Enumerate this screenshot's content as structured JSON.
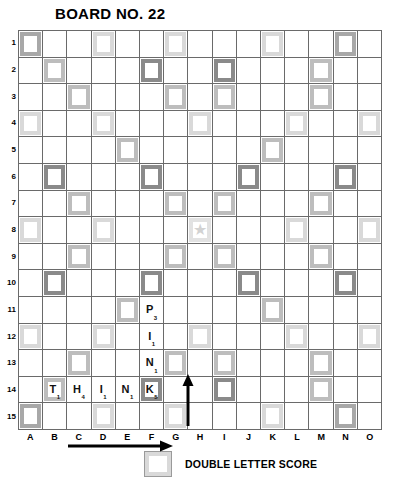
{
  "title": "BOARD NO. 22",
  "board": {
    "columns": [
      "A",
      "B",
      "C",
      "D",
      "E",
      "F",
      "G",
      "H",
      "I",
      "J",
      "K",
      "L",
      "M",
      "N",
      "O"
    ],
    "rows": [
      "1",
      "2",
      "3",
      "4",
      "5",
      "6",
      "7",
      "8",
      "9",
      "10",
      "11",
      "12",
      "13",
      "14",
      "15"
    ],
    "center_star": "star",
    "premium_squares": {
      "note": "grid of 15 rows x 15 cols; codes: '' none, 'dls' double letter, 'dls2' double letter dark, 'tls' triple letter, 'tws' triple word",
      "cells": [
        [
          "tws",
          "",
          "",
          "dls",
          "",
          "",
          "dls",
          "",
          "",
          "",
          "dls",
          "",
          "",
          "tws",
          ""
        ],
        [
          "",
          "dls2",
          "",
          "",
          "",
          "tls",
          "",
          "",
          "tls",
          "",
          "",
          "",
          "dls2",
          "",
          ""
        ],
        [
          "",
          "",
          "dls2",
          "",
          "",
          "",
          "dls2",
          "",
          "dls2",
          "",
          "",
          "",
          "dls2",
          "",
          ""
        ],
        [
          "dls",
          "",
          "",
          "dls",
          "",
          "",
          "",
          "dls",
          "",
          "",
          "",
          "dls",
          "",
          "",
          "dls"
        ],
        [
          "",
          "",
          "",
          "",
          "dls2",
          "",
          "",
          "",
          "",
          "",
          "dls2",
          "",
          "",
          "",
          ""
        ],
        [
          "",
          "tls",
          "",
          "",
          "",
          "tls",
          "",
          "",
          "",
          "tls",
          "",
          "",
          "",
          "tls",
          ""
        ],
        [
          "",
          "",
          "dls2",
          "",
          "",
          "",
          "dls2",
          "",
          "dls2",
          "",
          "",
          "",
          "dls2",
          "",
          ""
        ],
        [
          "dls",
          "",
          "",
          "dls",
          "",
          "",
          "",
          "center",
          "",
          "",
          "",
          "dls",
          "",
          "",
          "dls"
        ],
        [
          "",
          "",
          "dls2",
          "",
          "",
          "",
          "dls2",
          "",
          "dls2",
          "",
          "",
          "",
          "dls2",
          "",
          ""
        ],
        [
          "",
          "tls",
          "",
          "",
          "",
          "tls",
          "",
          "",
          "",
          "tls",
          "",
          "",
          "",
          "tls",
          ""
        ],
        [
          "",
          "",
          "",
          "",
          "dls2",
          "",
          "",
          "",
          "",
          "",
          "dls2",
          "",
          "",
          "",
          ""
        ],
        [
          "dls",
          "",
          "",
          "dls",
          "",
          "",
          "",
          "dls",
          "",
          "",
          "",
          "dls",
          "",
          "",
          "dls"
        ],
        [
          "",
          "",
          "dls2",
          "",
          "",
          "",
          "dls2",
          "",
          "dls2",
          "",
          "",
          "",
          "dls2",
          "",
          ""
        ],
        [
          "",
          "dls2",
          "",
          "",
          "",
          "tls",
          "",
          "",
          "tls",
          "",
          "",
          "",
          "dls2",
          "",
          ""
        ],
        [
          "tws",
          "",
          "",
          "dls",
          "",
          "",
          "dls",
          "",
          "",
          "",
          "dls",
          "",
          "",
          "tws",
          ""
        ]
      ]
    },
    "tiles": [
      {
        "row": 11,
        "col": "F",
        "letter": "P",
        "value": "3"
      },
      {
        "row": 12,
        "col": "F",
        "letter": "I",
        "value": "1"
      },
      {
        "row": 13,
        "col": "F",
        "letter": "N",
        "value": "1"
      },
      {
        "row": 14,
        "col": "B",
        "letter": "T",
        "value": "1"
      },
      {
        "row": 14,
        "col": "C",
        "letter": "H",
        "value": "4"
      },
      {
        "row": 14,
        "col": "D",
        "letter": "I",
        "value": "1"
      },
      {
        "row": 14,
        "col": "E",
        "letter": "N",
        "value": "1"
      },
      {
        "row": 14,
        "col": "F",
        "letter": "K",
        "value": "5"
      }
    ],
    "annotations": [
      {
        "name": "horizontal-play-arrow",
        "direction": "right",
        "row": 15,
        "from_col": "C",
        "to_col": "F"
      },
      {
        "name": "vertical-play-arrow",
        "direction": "up",
        "col": "G",
        "from_row": 14,
        "to_row": 13
      }
    ]
  },
  "legend": {
    "swatch_name": "double-letter-swatch",
    "label": "DOUBLE LETTER SCORE"
  }
}
